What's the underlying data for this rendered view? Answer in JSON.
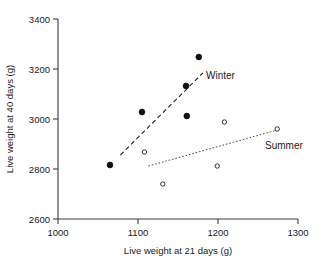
{
  "chart_data": {
    "type": "scatter",
    "title": "",
    "xlabel": "Live weight at 21 days (g)",
    "ylabel": "Live weight at 40 days (g)",
    "xlim": [
      1000,
      1300
    ],
    "ylim": [
      2600,
      3400
    ],
    "xticks": [
      1000,
      1100,
      1200,
      1300
    ],
    "yticks": [
      2600,
      2800,
      3000,
      3200,
      3400
    ],
    "xtick_labels": [
      "1000",
      "1100",
      "1200",
      "1300"
    ],
    "ytick_labels": [
      "2600",
      "2800",
      "3000",
      "3200",
      "3400"
    ],
    "grid": false,
    "legend_position": "inline-annotations",
    "series": [
      {
        "name": "Winter",
        "marker": "filled-circle",
        "color": "#111111",
        "points": [
          {
            "x": 1065,
            "y": 2816
          },
          {
            "x": 1105,
            "y": 3028
          },
          {
            "x": 1160,
            "y": 3132
          },
          {
            "x": 1161,
            "y": 3012
          },
          {
            "x": 1176,
            "y": 3248
          }
        ],
        "trendline": {
          "style": "dashed",
          "x1": 1078,
          "y1": 2856,
          "x2": 1181,
          "y2": 3184
        }
      },
      {
        "name": "Summer",
        "marker": "open-circle",
        "color": "#333333",
        "points": [
          {
            "x": 1108,
            "y": 2868
          },
          {
            "x": 1131,
            "y": 2740
          },
          {
            "x": 1199,
            "y": 2812
          },
          {
            "x": 1208,
            "y": 2988
          },
          {
            "x": 1274,
            "y": 2960
          }
        ],
        "trendline": {
          "style": "dotted",
          "x1": 1113,
          "y1": 2812,
          "x2": 1274,
          "y2": 2956
        }
      }
    ],
    "annotations": [
      {
        "text": "Winter",
        "x": 1186,
        "y": 3172
      },
      {
        "text": "Summer",
        "x": 1268,
        "y": 2900
      }
    ]
  }
}
